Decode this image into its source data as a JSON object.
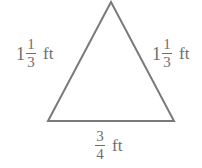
{
  "diagram": {
    "shape": "triangle",
    "type": "isosceles",
    "stroke_color": "#7a7a7a",
    "text_color": "#6e6e6e",
    "vertices": {
      "apex": [
        111,
        2
      ],
      "bottom_left": [
        48,
        121
      ],
      "bottom_right": [
        174,
        121
      ]
    },
    "sides": {
      "left": {
        "whole": "1",
        "numerator": "1",
        "denominator": "3",
        "unit": "ft"
      },
      "right": {
        "whole": "1",
        "numerator": "1",
        "denominator": "3",
        "unit": "ft"
      },
      "base": {
        "numerator": "3",
        "denominator": "4",
        "unit": "ft"
      }
    }
  }
}
